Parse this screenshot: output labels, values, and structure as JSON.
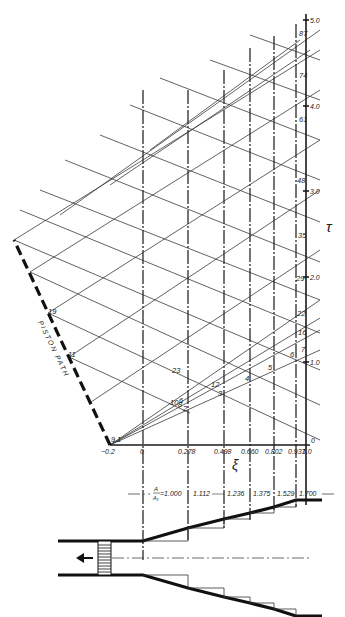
{
  "figure": {
    "axes": {
      "xi_label": "ξ",
      "tau_label": "τ",
      "xi_ticks": [
        {
          "value": -0.2,
          "label": "−0.2",
          "x": 110
        },
        {
          "value": 0,
          "label": "0",
          "x": 143
        },
        {
          "value": 0.278,
          "label": "0.278",
          "x": 188
        },
        {
          "value": 0.498,
          "label": "0.498",
          "x": 224
        },
        {
          "value": 0.66,
          "label": "0.660",
          "x": 250
        },
        {
          "value": 0.802,
          "label": "0.802",
          "x": 274
        },
        {
          "value": 0.937,
          "label": "0.937",
          "x": 296
        },
        {
          "value": 1.0,
          "label": "1.0",
          "x": 306
        }
      ],
      "tau_ticks": [
        {
          "value": 0,
          "label": "0",
          "y": 445
        },
        {
          "value": 1.0,
          "label": "1.0",
          "y": 362
        },
        {
          "value": 2.0,
          "label": "2.0",
          "y": 277
        },
        {
          "value": 3.0,
          "label": "3.0",
          "y": 191
        },
        {
          "value": 4.0,
          "label": "4.0",
          "y": 106
        },
        {
          "value": 5.0,
          "label": "5.0",
          "y": 20
        }
      ]
    },
    "piston_path_label": "PISTON PATH",
    "point_labels": [
      {
        "label": "9",
        "x": 111,
        "y": 442
      },
      {
        "label": "1",
        "x": 117,
        "y": 442
      },
      {
        "label": "10",
        "x": 170,
        "y": 405
      },
      {
        "label": "8",
        "x": 178,
        "y": 407
      },
      {
        "label": "6",
        "x": 179,
        "y": 403
      },
      {
        "label": "2",
        "x": 183,
        "y": 411
      },
      {
        "label": "23",
        "x": 172,
        "y": 373
      },
      {
        "label": "12",
        "x": 211,
        "y": 387
      },
      {
        "label": "3",
        "x": 218,
        "y": 396
      },
      {
        "label": "4",
        "x": 245,
        "y": 381
      },
      {
        "label": "5",
        "x": 268,
        "y": 370
      },
      {
        "label": "6",
        "x": 290,
        "y": 357
      },
      {
        "label": "7",
        "x": 301,
        "y": 352
      },
      {
        "label": "16",
        "x": 298,
        "y": 335
      },
      {
        "label": "22",
        "x": 297,
        "y": 316
      },
      {
        "label": "29",
        "x": 296,
        "y": 281
      },
      {
        "label": "35",
        "x": 298,
        "y": 238
      },
      {
        "label": "48",
        "x": 297,
        "y": 183
      },
      {
        "label": "61",
        "x": 299,
        "y": 122
      },
      {
        "label": "74",
        "x": 299,
        "y": 78
      },
      {
        "label": "87",
        "x": 299,
        "y": 36
      },
      {
        "label": "19",
        "x": 48,
        "y": 314
      },
      {
        "label": "11",
        "x": 68,
        "y": 357
      }
    ],
    "area_ratio": {
      "label_num": "A",
      "label_den": "A₁",
      "values": [
        "=1.000",
        "1.112",
        "1.236",
        "1.375",
        "1.529",
        "1.700"
      ]
    },
    "piston_direction_icon": "arrow-left-icon"
  }
}
